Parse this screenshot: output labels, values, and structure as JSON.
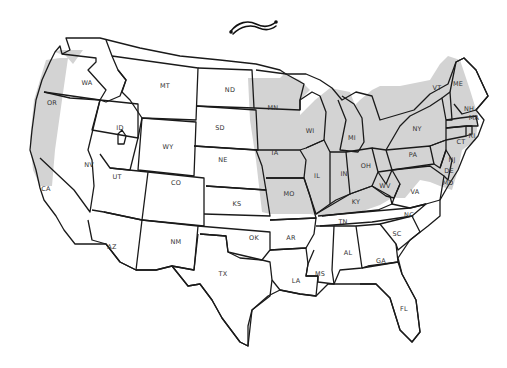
{
  "map": {
    "title_ornament": "decorative-swash",
    "colors": {
      "shaded": "#d3d3d3",
      "unshaded": "#ffffff",
      "border": "#1a1a1a",
      "label": "#333333"
    },
    "shaded_note": "Shaded band covers western OR/WA/CA coast strip and eastern plains band plus Midwest/Northeast states",
    "states": [
      {
        "abbr": "WA",
        "shaded": "partial",
        "x": 87,
        "y": 85
      },
      {
        "abbr": "OR",
        "shaded": "partial",
        "x": 52,
        "y": 105
      },
      {
        "abbr": "CA",
        "shaded": "partial",
        "x": 46,
        "y": 191
      },
      {
        "abbr": "ID",
        "shaded": false,
        "x": 120,
        "y": 130
      },
      {
        "abbr": "NV",
        "shaded": false,
        "x": 89,
        "y": 167
      },
      {
        "abbr": "MT",
        "shaded": false,
        "x": 165,
        "y": 88
      },
      {
        "abbr": "WY",
        "shaded": false,
        "x": 168,
        "y": 149
      },
      {
        "abbr": "UT",
        "shaded": false,
        "x": 117,
        "y": 179
      },
      {
        "abbr": "CO",
        "shaded": false,
        "x": 176,
        "y": 185
      },
      {
        "abbr": "AZ",
        "shaded": false,
        "x": 112,
        "y": 249
      },
      {
        "abbr": "NM",
        "shaded": false,
        "x": 176,
        "y": 244
      },
      {
        "abbr": "ND",
        "shaded": false,
        "x": 230,
        "y": 92
      },
      {
        "abbr": "SD",
        "shaded": false,
        "x": 220,
        "y": 130
      },
      {
        "abbr": "NE",
        "shaded": false,
        "x": 223,
        "y": 162
      },
      {
        "abbr": "KS",
        "shaded": false,
        "x": 237,
        "y": 206
      },
      {
        "abbr": "OK",
        "shaded": false,
        "x": 254,
        "y": 240
      },
      {
        "abbr": "TX",
        "shaded": false,
        "x": 223,
        "y": 276
      },
      {
        "abbr": "MN",
        "shaded": true,
        "x": 273,
        "y": 110
      },
      {
        "abbr": "IA",
        "shaded": true,
        "x": 275,
        "y": 155
      },
      {
        "abbr": "MO",
        "shaded": true,
        "x": 289,
        "y": 196
      },
      {
        "abbr": "AR",
        "shaded": false,
        "x": 291,
        "y": 240
      },
      {
        "abbr": "LA",
        "shaded": false,
        "x": 296,
        "y": 283
      },
      {
        "abbr": "WI",
        "shaded": true,
        "x": 310,
        "y": 133
      },
      {
        "abbr": "IL",
        "shaded": true,
        "x": 317,
        "y": 178
      },
      {
        "abbr": "MI",
        "shaded": true,
        "x": 352,
        "y": 140
      },
      {
        "abbr": "IN",
        "shaded": true,
        "x": 344,
        "y": 176
      },
      {
        "abbr": "OH",
        "shaded": true,
        "x": 366,
        "y": 168
      },
      {
        "abbr": "KY",
        "shaded": true,
        "x": 356,
        "y": 204
      },
      {
        "abbr": "TN",
        "shaded": false,
        "x": 343,
        "y": 224
      },
      {
        "abbr": "MS",
        "shaded": false,
        "x": 320,
        "y": 276
      },
      {
        "abbr": "AL",
        "shaded": false,
        "x": 348,
        "y": 255
      },
      {
        "abbr": "GA",
        "shaded": false,
        "x": 381,
        "y": 263
      },
      {
        "abbr": "FL",
        "shaded": false,
        "x": 404,
        "y": 311
      },
      {
        "abbr": "SC",
        "shaded": false,
        "x": 397,
        "y": 236
      },
      {
        "abbr": "NC",
        "shaded": false,
        "x": 409,
        "y": 217
      },
      {
        "abbr": "VA",
        "shaded": false,
        "x": 415,
        "y": 194
      },
      {
        "abbr": "WV",
        "shaded": true,
        "x": 385,
        "y": 188
      },
      {
        "abbr": "PA",
        "shaded": true,
        "x": 413,
        "y": 157
      },
      {
        "abbr": "NY",
        "shaded": true,
        "x": 417,
        "y": 131
      },
      {
        "abbr": "VT",
        "shaded": true,
        "x": 437,
        "y": 90
      },
      {
        "abbr": "NH",
        "shaded": true,
        "x": 469,
        "y": 111
      },
      {
        "abbr": "ME",
        "shaded": true,
        "x": 458,
        "y": 86
      },
      {
        "abbr": "MA",
        "shaded": true,
        "x": 474,
        "y": 120
      },
      {
        "abbr": "RI",
        "shaded": true,
        "x": 472,
        "y": 138
      },
      {
        "abbr": "CT",
        "shaded": true,
        "x": 461,
        "y": 144
      },
      {
        "abbr": "NJ",
        "shaded": true,
        "x": 452,
        "y": 162
      },
      {
        "abbr": "DE",
        "shaded": true,
        "x": 449,
        "y": 173
      },
      {
        "abbr": "MD",
        "shaded": true,
        "x": 448,
        "y": 185
      }
    ]
  }
}
